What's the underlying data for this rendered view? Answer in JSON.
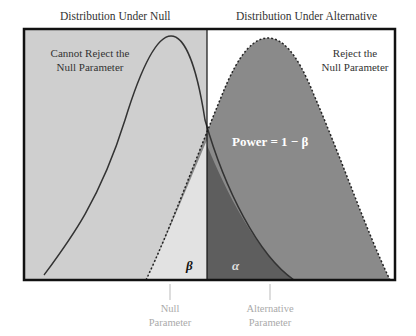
{
  "headers": {
    "null": "Distribution Under Null",
    "alternative": "Distribution Under Alternative"
  },
  "regions": {
    "left": "Cannot Reject the Null Parameter",
    "left_line1": "Cannot Reject the",
    "left_line2": "Null Parameter",
    "right_line1": "Reject the",
    "right_line2": "Null Parameter"
  },
  "annotations": {
    "power": "Power = 1 − β",
    "beta": "β",
    "alpha": "α"
  },
  "axis_labels": {
    "null_line1": "Null",
    "null_line2": "Parameter",
    "alt_line1": "Alternative",
    "alt_line2": "Parameter"
  },
  "colors": {
    "accept_region": "#cfcfcf",
    "power": "#8a8a8a",
    "alpha": "#5e5e5e",
    "beta": "#e2e2e2",
    "frame": "#111111"
  }
}
